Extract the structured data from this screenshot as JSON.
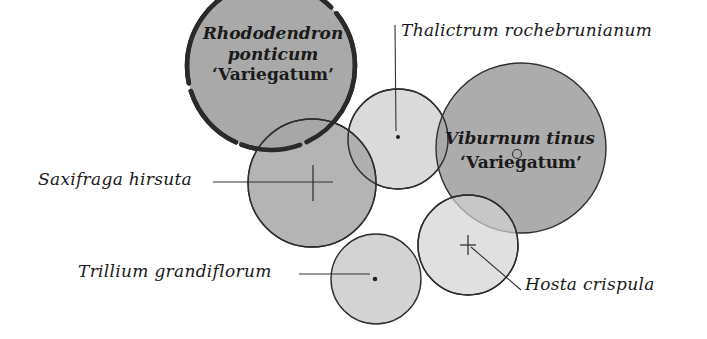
{
  "diagram": {
    "colors": {
      "background": "#ffffff",
      "dark_fill": "#a6a6a6",
      "mid_fill": "#b3b3b3",
      "light_fill": "#d2d2d2",
      "outline": "#2e2e2e"
    },
    "plants": [
      {
        "id": "rhododendron",
        "name_line1": "Rhododendron",
        "name_line2": "ponticum",
        "cultivar": "‘Variegatum’",
        "marker": "none",
        "outline": "thick-dashed"
      },
      {
        "id": "thalictrum",
        "name": "Thalictrum rochebrunianum",
        "marker": "dot"
      },
      {
        "id": "viburnum",
        "name": "Viburnum tinus",
        "cultivar": "‘Variegatum’",
        "marker": "small-circle"
      },
      {
        "id": "saxifraga",
        "name": "Saxifraga hirsuta",
        "marker": "cross"
      },
      {
        "id": "trillium",
        "name": "Trillium grandiflorum",
        "marker": "dot"
      },
      {
        "id": "hosta",
        "name": "Hosta crispula",
        "marker": "cross"
      }
    ]
  }
}
